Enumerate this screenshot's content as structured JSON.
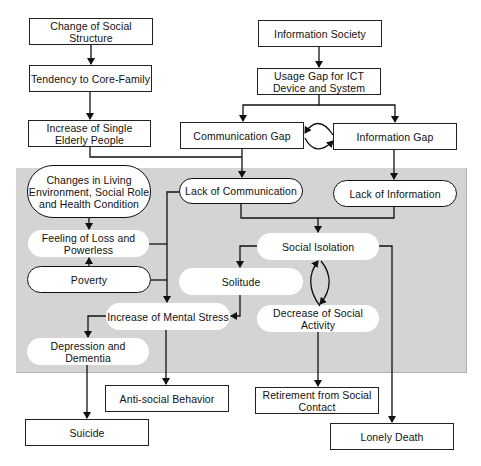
{
  "diagram": {
    "type": "flowchart",
    "region": {
      "label": "",
      "fill": "#d4d4d4"
    },
    "nodes": {
      "change_social_structure": "Change of Social Structure",
      "tendency_core_family": "Tendency to Core-Family",
      "increase_single_elderly": "Increase of Single Elderly People",
      "information_society": "Information Society",
      "usage_gap_ict": "Usage Gap for ICT Device and System",
      "communication_gap": "Communication Gap",
      "information_gap": "Information Gap",
      "changes_living_env": "Changes in Living Environment, Social Role and Health Condition",
      "lack_communication": "Lack of Communication",
      "lack_information": "Lack of Information",
      "feeling_loss": "Feeling of Loss and Powerless",
      "social_isolation": "Social Isolation",
      "poverty": "Poverty",
      "solitude": "Solitude",
      "increase_mental_stress": "Increase of Mental Stress",
      "decrease_social_activity": "Decrease of Social Activity",
      "depression_dementia": "Depression and Dementia",
      "anti_social_behavior": "Anti-social Behavior",
      "retirement_social_contact": "Retirement from Social Contact",
      "suicide": "Suicide",
      "lonely_death": "Lonely Death"
    },
    "edges": [
      [
        "Change of Social Structure",
        "Tendency to Core-Family"
      ],
      [
        "Tendency to Core-Family",
        "Increase of Single Elderly People"
      ],
      [
        "Increase of Single Elderly People",
        "Lack of Communication"
      ],
      [
        "Information Society",
        "Usage Gap for ICT Device and System"
      ],
      [
        "Usage Gap for ICT Device and System",
        "Communication Gap"
      ],
      [
        "Usage Gap for ICT Device and System",
        "Information Gap"
      ],
      [
        "Communication Gap",
        "Information Gap"
      ],
      [
        "Information Gap",
        "Communication Gap"
      ],
      [
        "Communication Gap",
        "Lack of Communication"
      ],
      [
        "Information Gap",
        "Lack of Information"
      ],
      [
        "Lack of Communication",
        "Social Isolation"
      ],
      [
        "Lack of Information",
        "Social Isolation"
      ],
      [
        "Lack of Communication",
        "Increase of Mental Stress"
      ],
      [
        "Changes in Living Environment, Social Role and Health Condition",
        "Feeling of Loss and Powerless"
      ],
      [
        "Poverty",
        "Feeling of Loss and Powerless"
      ],
      [
        "Feeling of Loss and Powerless",
        "Increase of Mental Stress"
      ],
      [
        "Poverty",
        "Increase of Mental Stress"
      ],
      [
        "Social Isolation",
        "Solitude"
      ],
      [
        "Social Isolation",
        "Decrease of Social Activity"
      ],
      [
        "Decrease of Social Activity",
        "Social Isolation"
      ],
      [
        "Solitude",
        "Increase of Mental Stress"
      ],
      [
        "Increase of Mental Stress",
        "Depression and Dementia"
      ],
      [
        "Increase of Mental Stress",
        "Anti-social Behavior"
      ],
      [
        "Depression and Dementia",
        "Suicide"
      ],
      [
        "Decrease of Social Activity",
        "Retirement from Social Contact"
      ],
      [
        "Social Isolation",
        "Lonely Death"
      ]
    ]
  }
}
